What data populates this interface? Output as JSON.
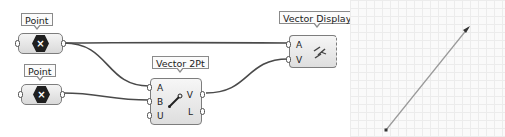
{
  "canvas": {
    "nodes": {
      "point_a": {
        "label": "Point",
        "icon": "cross-hex-icon",
        "glyph": "×"
      },
      "point_b": {
        "label": "Point",
        "icon": "cross-hex-icon",
        "glyph": "×"
      },
      "vector_2pt": {
        "label": "Vector 2Pt",
        "inputs": [
          "A",
          "B",
          "U"
        ],
        "outputs": [
          "V",
          "L"
        ],
        "icon": "vector-arrow-icon"
      },
      "vector_display": {
        "label": "Vector Display",
        "inputs": [
          "A",
          "V"
        ],
        "icon": "vector-display-icon"
      }
    },
    "wires": [
      {
        "from": "point_a",
        "to": "vector_display.A"
      },
      {
        "from": "point_a",
        "to": "vector_2pt.A"
      },
      {
        "from": "point_b",
        "to": "vector_2pt.B"
      },
      {
        "from": "vector_2pt.V",
        "to": "vector_display.V"
      }
    ],
    "colors": {
      "wire": "#4a4a4a",
      "node_border": "#7d7d7d",
      "hex_fill": "#1f1f1f"
    }
  },
  "viewport": {
    "grid": true,
    "vector_line": {
      "start": [
        36,
        130
      ],
      "end": [
        119,
        27
      ],
      "color": "#9a9a9a"
    }
  }
}
